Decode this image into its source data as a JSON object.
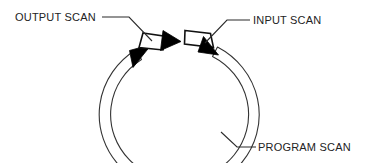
{
  "diagram": {
    "background_color": "#ffffff",
    "line_color": "#1a1a1a",
    "arrow_fill_color": "#000000",
    "band_fill_color": "#ffffff",
    "flow_direction": "clockwise",
    "segments": [
      {
        "id": "output-scan",
        "label": "OUTPUT SCAN",
        "position": "top-left",
        "shape": "tapered-band-with-arrowhead",
        "arrow_direction": "clockwise"
      },
      {
        "id": "input-scan",
        "label": "INPUT SCAN",
        "position": "top-right",
        "shape": "tapered-band-with-arrowhead",
        "arrow_direction": "clockwise"
      },
      {
        "id": "program-scan",
        "label": "PROGRAM SCAN",
        "position": "bottom-ring",
        "shape": "open-ring-with-arrowhead",
        "arrow_direction": "clockwise"
      }
    ],
    "callouts": [
      {
        "id": "callout-output-scan",
        "text": "OUTPUT SCAN",
        "text_x": 15,
        "text_y": 21,
        "leader": "M102,17 L129,17 L152,41"
      },
      {
        "id": "callout-input-scan",
        "text": "INPUT SCAN",
        "text_x": 253,
        "text_y": 24,
        "leader": "M250,20 L227,20 L205,43"
      },
      {
        "id": "callout-program-scan",
        "text": "PROGRAM SCAN",
        "text_x": 258,
        "text_y": 151,
        "leader": "M256,147 L237,147 L221,132"
      }
    ]
  }
}
